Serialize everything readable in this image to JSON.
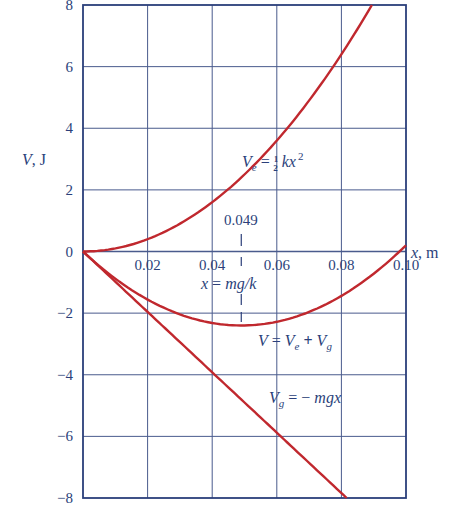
{
  "chart_data": {
    "type": "line",
    "title": "",
    "xlabel": "x, m",
    "ylabel": "V, J",
    "xlim": [
      0,
      0.1
    ],
    "ylim": [
      -8,
      8
    ],
    "grid": true,
    "x_ticks": [
      "0.02",
      "0.04",
      "0.06",
      "0.08",
      "0.10"
    ],
    "y_ticks": [
      "8",
      "6",
      "4",
      "2",
      "0",
      "−2",
      "−4",
      "−6",
      "−8"
    ],
    "x": [
      0,
      0.01,
      0.02,
      0.03,
      0.04,
      0.049,
      0.06,
      0.07,
      0.08,
      0.0876,
      0.0816,
      0.097,
      0.1
    ],
    "series": [
      {
        "name": "V_e = ½ kx²",
        "label": "Ve = ½ kx²",
        "x": [
          0,
          0.01,
          0.02,
          0.03,
          0.04,
          0.05,
          0.06,
          0.07,
          0.08,
          0.0876
        ],
        "values": [
          0,
          0.1,
          0.4,
          0.9,
          1.6,
          2.5,
          3.6,
          4.9,
          6.4,
          7.67
        ]
      },
      {
        "name": "V_g = −mgx",
        "label": "Vg = − mgx",
        "x": [
          0,
          0.02,
          0.04,
          0.06,
          0.08,
          0.0816
        ],
        "values": [
          0,
          -1.96,
          -3.92,
          -5.88,
          -7.84,
          -8.0
        ]
      },
      {
        "name": "V = V_e + V_g",
        "label": "V = Ve + Vg",
        "x": [
          0,
          0.01,
          0.02,
          0.03,
          0.04,
          0.049,
          0.06,
          0.07,
          0.08,
          0.09,
          0.098,
          0.1
        ],
        "values": [
          0,
          -0.88,
          -1.56,
          -2.04,
          -2.32,
          -2.4,
          -2.28,
          -1.96,
          -1.44,
          -0.72,
          0,
          0.2
        ]
      }
    ],
    "annotations": [
      {
        "text": "0.049",
        "x": 0.049,
        "note": "dashed marker at minimum"
      },
      {
        "text": "x = mg/k",
        "x": 0.049
      }
    ],
    "params": {
      "k_N_per_m": 2000,
      "mg_N": 98
    }
  },
  "labels": {
    "y_axis": {
      "main": "V",
      "unit": ", J"
    },
    "x_axis": {
      "main": "x",
      "unit": ", m"
    },
    "ve": {
      "a": "V",
      "sub": "e",
      "b": " = ",
      "frac_num": "1",
      "frac_den": "2",
      "c": " kx",
      "sup": "2"
    },
    "v": {
      "a": "V",
      "b": " = ",
      "c": "V",
      "csub": "e",
      "d": " + ",
      "e": "V",
      "esub": "g"
    },
    "vg": {
      "a": "V",
      "sub": "g",
      "b": " = − ",
      "c": "mgx"
    },
    "min_value": "0.049",
    "min_eq": {
      "a": "x",
      "b": " = ",
      "c": "mg/k"
    }
  },
  "colors": {
    "grid": "#2b3f7a",
    "curve": "#c0282e",
    "text": "#2b3f7a"
  }
}
